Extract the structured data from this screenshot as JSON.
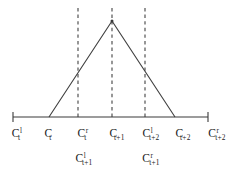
{
  "figure": {
    "type": "triangular-membership-function",
    "background_color": "#ffffff",
    "line_color": "#3a3a3a",
    "axis": {
      "y": 117,
      "x_start": 13,
      "x_end": 208,
      "tick_half_height": 5,
      "ticks": [
        13,
        208
      ]
    },
    "tent": {
      "left_base_x": 49,
      "apex_x": 112,
      "apex_y": 21,
      "right_base_x": 175,
      "baseline_y": 117
    },
    "dashed_guides": [
      {
        "x": 78,
        "y_top": 8,
        "y_bottom": 117
      },
      {
        "x": 112,
        "y_top": 8,
        "y_bottom": 117
      },
      {
        "x": 145,
        "y_top": 8,
        "y_bottom": 117
      }
    ]
  },
  "labels": {
    "row_top_y": 128,
    "row_bottom_y": 153,
    "top": [
      {
        "name": "c-l-t",
        "x": 16,
        "base": "C",
        "sup": "l",
        "sub": "t"
      },
      {
        "name": "c-t",
        "x": 48,
        "base": "C",
        "sup": "",
        "sub": "t"
      },
      {
        "name": "c-r-t",
        "x": 82,
        "base": "C",
        "sup": "r",
        "sub": "t"
      },
      {
        "name": "c-t1",
        "x": 117,
        "base": "C",
        "sup": "",
        "sub": "t+1"
      },
      {
        "name": "c-l-t2",
        "x": 151,
        "base": "C",
        "sup": "l",
        "sub": "t+2"
      },
      {
        "name": "c-t2",
        "x": 183,
        "base": "C",
        "sup": "",
        "sub": "t+2"
      },
      {
        "name": "c-r-t2",
        "x": 217,
        "base": "C",
        "sup": "r",
        "sub": "t+2"
      }
    ],
    "bottom": [
      {
        "name": "c-l-t1",
        "x": 84,
        "base": "C",
        "sup": "l",
        "sub": "t+1"
      },
      {
        "name": "c-r-t1",
        "x": 151,
        "base": "C",
        "sup": "r",
        "sub": "t+1"
      }
    ]
  }
}
